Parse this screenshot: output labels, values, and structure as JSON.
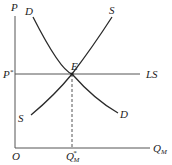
{
  "diagram": {
    "type": "supply-demand",
    "axes": {
      "y_label": "P",
      "x_label_main": "Q",
      "x_label_sub": "M",
      "origin_label": "O"
    },
    "curves": {
      "demand_label_top": "D",
      "demand_label_bottom": "D",
      "supply_label_top": "S",
      "supply_label_bottom": "S",
      "long_run_supply_label": "LS"
    },
    "equilibrium": {
      "point_label": "E",
      "price_label_main": "P",
      "price_label_sup": "*",
      "quantity_label_main": "Q",
      "quantity_label_sup": "*",
      "quantity_label_sub": "M"
    }
  }
}
